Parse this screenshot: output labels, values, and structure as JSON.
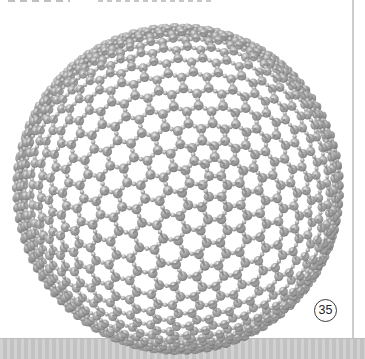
{
  "figure": {
    "number": "35"
  },
  "page": {
    "background": "#ffffff",
    "bottom_band_color": "#c9c9c9",
    "edge_line_color": "#cdcdcd",
    "artifact_color": "#c2c2c2"
  },
  "molecule": {
    "description": "giant icosahedral fullerene sphere, gray ball-and-stick model with small joint spheres at bond midpoints",
    "frequency": 10,
    "center_x": 178,
    "center_y": 189,
    "radius_px": 162,
    "camera_distance": 4,
    "atom_radius_px": 3.8,
    "joint_radius_px": 1.75,
    "bond_width_px": 1.8,
    "rot_x": 0.45,
    "rot_y": 0.18,
    "cull_z": -0.08,
    "colors": {
      "ball_hi": "#ebebeb",
      "ball_mid": "#a6a6a6",
      "ball_base": "#8b8b8b",
      "ball_dark": "#585858",
      "joint_hi": "#f0f0f0",
      "joint_mid": "#b2b2b2",
      "joint_dark": "#6e6e6e",
      "bond": "#8f8f8f"
    }
  }
}
